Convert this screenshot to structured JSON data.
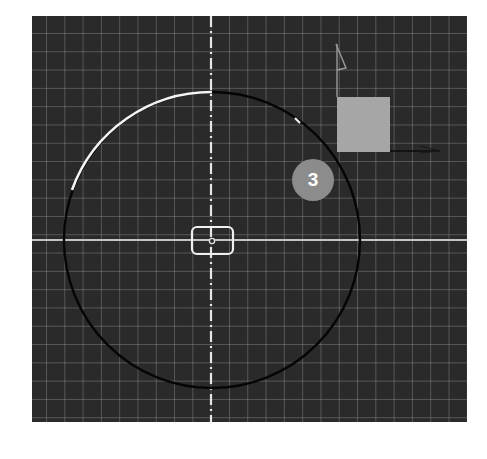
{
  "viewport": {
    "background_color": "#2a2a2a",
    "grid_color": "#6a6a6a",
    "grid_spacing_px": 18.3
  },
  "axes": {
    "horizontal": {
      "name": "x-axis-line",
      "color": "#bdbdbd"
    },
    "vertical": {
      "name": "y-axis-dashed-centerline",
      "color": "#e0e0e0",
      "style": "dashed"
    }
  },
  "circle": {
    "center": [
      212,
      241
    ],
    "radius": 148,
    "stroke_color": "#000000",
    "highlight_arc_color": "#ffffff",
    "highlight_arc_from_deg": 90,
    "highlight_arc_to_deg": 158
  },
  "center_marker": {
    "shape": "rounded-rectangle",
    "color": "#f0f0f0"
  },
  "grip_tick": {
    "color": "#ffffff"
  },
  "ucs_icon": {
    "square_color": "#a6a6a6",
    "y_arrow_color": "#9a9a9a",
    "x_arrow_color": "#111111"
  },
  "badge": {
    "label": "3",
    "color": "#8c8c8c",
    "text_color": "#ffffff"
  }
}
